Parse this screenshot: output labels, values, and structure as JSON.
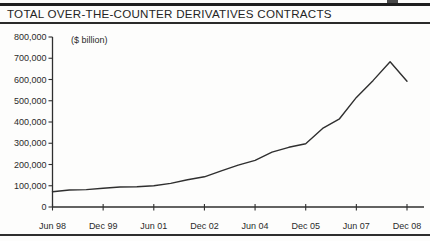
{
  "page": {
    "title": "TOTAL OVER-THE-COUNTER DERIVATIVES CONTRACTS"
  },
  "chart_data": {
    "type": "line",
    "title": "TOTAL OVER-THE-COUNTER DERIVATIVES CONTRACTS",
    "unit_label": "($ billion)",
    "categories": [
      "Jun 98",
      "Dec 98",
      "Jun 99",
      "Dec 99",
      "Jun 00",
      "Dec 00",
      "Jun 01",
      "Dec 01",
      "Jun 02",
      "Dec 02",
      "Jun 03",
      "Dec 03",
      "Jun 04",
      "Dec 04",
      "Jun 05",
      "Dec 05",
      "Jun 06",
      "Dec 06",
      "Jun 07",
      "Dec 07",
      "Jun 08",
      "Dec 08"
    ],
    "values": [
      72000,
      80000,
      82000,
      88000,
      94000,
      95000,
      100000,
      111000,
      128000,
      142000,
      170000,
      197000,
      220000,
      258000,
      281000,
      298000,
      370000,
      415000,
      516000,
      596000,
      684000,
      592000
    ],
    "x_tick_labels": [
      "Jun 98",
      "Dec 99",
      "Jun 01",
      "Dec 02",
      "Jun 04",
      "Dec 05",
      "Jun 07",
      "Dec 08"
    ],
    "x_tick_every": 3,
    "y_ticks": [
      0,
      100000,
      200000,
      300000,
      400000,
      500000,
      600000,
      700000,
      800000
    ],
    "ylim": [
      0,
      800000
    ],
    "grid": false,
    "legend": "none",
    "line_color": "#2f2f2f",
    "axis_color": "#2f2f2f",
    "text_color": "#2b2b2b"
  }
}
